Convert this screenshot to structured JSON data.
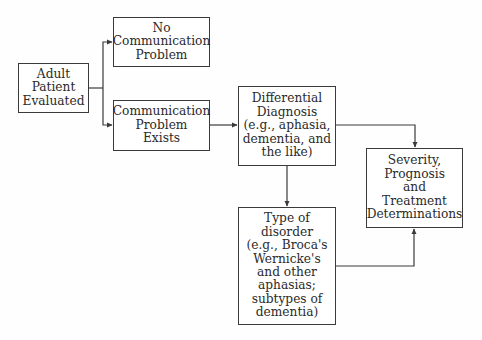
{
  "diagram": {
    "type": "flowchart",
    "nodes": {
      "adult": {
        "label": "Adult\nPatient\nEvaluated"
      },
      "no_problem": {
        "label": "No\nCommunication\nProblem"
      },
      "problem_exists": {
        "label": "Communication\nProblem\nExists"
      },
      "differential": {
        "label": "Differential\nDiagnosis\n(e.g., aphasia,\ndementia, and\nthe like)"
      },
      "type_disorder": {
        "label": "Type of\ndisorder\n(e.g., Broca's\nWernicke's\nand other\naphasias;\nsubtypes of\ndementia)"
      },
      "severity": {
        "label": "Severity,\nPrognosis\nand\nTreatment\nDeterminations"
      }
    },
    "edges": [
      {
        "from": "adult",
        "to": "no_problem"
      },
      {
        "from": "adult",
        "to": "problem_exists"
      },
      {
        "from": "problem_exists",
        "to": "differential"
      },
      {
        "from": "differential",
        "to": "type_disorder"
      },
      {
        "from": "differential",
        "to": "severity"
      },
      {
        "from": "type_disorder",
        "to": "severity"
      }
    ],
    "colors": {
      "line": "#3a3a3a",
      "text": "#2a2a2a",
      "background": "#ffffff"
    }
  }
}
